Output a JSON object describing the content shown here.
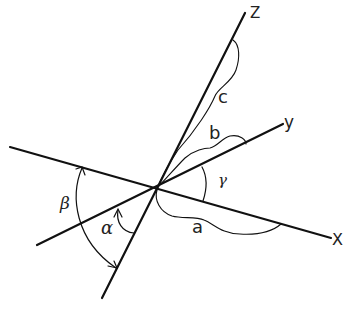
{
  "diagram": {
    "axes": {
      "x": {
        "label": "X"
      },
      "y": {
        "label": "y"
      },
      "z": {
        "label": "Z"
      }
    },
    "lengths": {
      "a": {
        "label": "a"
      },
      "b": {
        "label": "b"
      },
      "c": {
        "label": "c"
      }
    },
    "angles": {
      "alpha": {
        "label": "α"
      },
      "beta": {
        "label": "β"
      },
      "gamma": {
        "label": "γ"
      }
    },
    "colors": {
      "line": "#111111",
      "background": "#ffffff"
    }
  }
}
